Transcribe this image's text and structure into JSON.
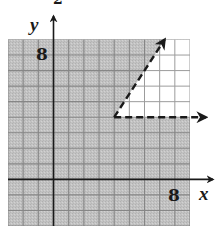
{
  "chart_data": {
    "type": "inequality-region",
    "title": "",
    "xlabel": "x",
    "ylabel": "y",
    "xlim": [
      -3,
      9
    ],
    "ylim": [
      -3,
      9
    ],
    "grid": true,
    "grid_step": 1,
    "tick_labels": {
      "x": [
        {
          "value": 8,
          "label": "8"
        }
      ],
      "y": [
        {
          "value": 8,
          "label": "8"
        }
      ]
    },
    "boundaries": [
      {
        "name": "horizontal-ray",
        "equation": "y = 4",
        "style": "dashed",
        "start": [
          4,
          4
        ],
        "end": [
          9,
          4
        ],
        "arrow": true
      },
      {
        "name": "slanted-ray",
        "equation": "y = (3/2)x - 2",
        "style": "dashed",
        "start": [
          4,
          4
        ],
        "end": [
          7.33,
          9
        ],
        "arrow": true
      }
    ],
    "vertex": [
      4,
      4
    ],
    "unshaded_region": {
      "description": "y > 4 and y < (3/2)x - 2",
      "polygon": [
        [
          4,
          4
        ],
        [
          9,
          4
        ],
        [
          9,
          9
        ],
        [
          7.33,
          9
        ]
      ]
    },
    "shaded_region": "all of grid except the unshaded wedge",
    "colors": {
      "shade": "#c2c2c2",
      "shade_grid": "#868686",
      "white_grid": "#9c9c9c",
      "axis": "#1a1a1a",
      "boundary": "#1a1a1a"
    }
  },
  "labels": {
    "x_axis": "x",
    "y_axis": "y",
    "x_tick_8": "8",
    "y_tick_8": "8",
    "top_fragment": "2"
  }
}
